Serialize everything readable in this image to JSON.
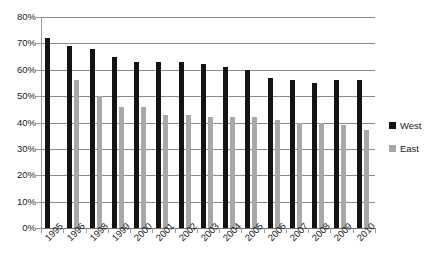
{
  "chart_data": {
    "type": "bar",
    "title": "",
    "subtitle": "",
    "xlabel": "",
    "ylabel": "",
    "ylim": [
      0,
      80
    ],
    "ytick_labels": [
      "0%",
      "10%",
      "20%",
      "30%",
      "40%",
      "50%",
      "60%",
      "70%",
      "80%"
    ],
    "ytick_values": [
      0,
      10,
      20,
      30,
      40,
      50,
      60,
      70,
      80
    ],
    "grid": true,
    "legend_position": "right",
    "categories": [
      "1995",
      "1996",
      "1998",
      "1999",
      "2000",
      "2001",
      "2002",
      "2003",
      "2004",
      "2005",
      "2006",
      "2007",
      "2008",
      "2009",
      "2010"
    ],
    "series": [
      {
        "name": "West",
        "color": "#141414",
        "values": [
          72,
          69,
          68,
          65,
          63,
          63,
          63,
          62,
          61,
          60,
          57,
          56,
          55,
          56,
          56
        ]
      },
      {
        "name": "East",
        "color": "#a8a8a8",
        "values": [
          null,
          56,
          50,
          46,
          46,
          43,
          43,
          42,
          42,
          42,
          41,
          40,
          40,
          39,
          37
        ]
      }
    ]
  },
  "legend": {
    "entries": [
      {
        "label": "West",
        "color": "#141414"
      },
      {
        "label": "East",
        "color": "#a8a8a8"
      }
    ]
  },
  "axis": {
    "y_max_label": "80%",
    "y_min_label": "0%"
  }
}
